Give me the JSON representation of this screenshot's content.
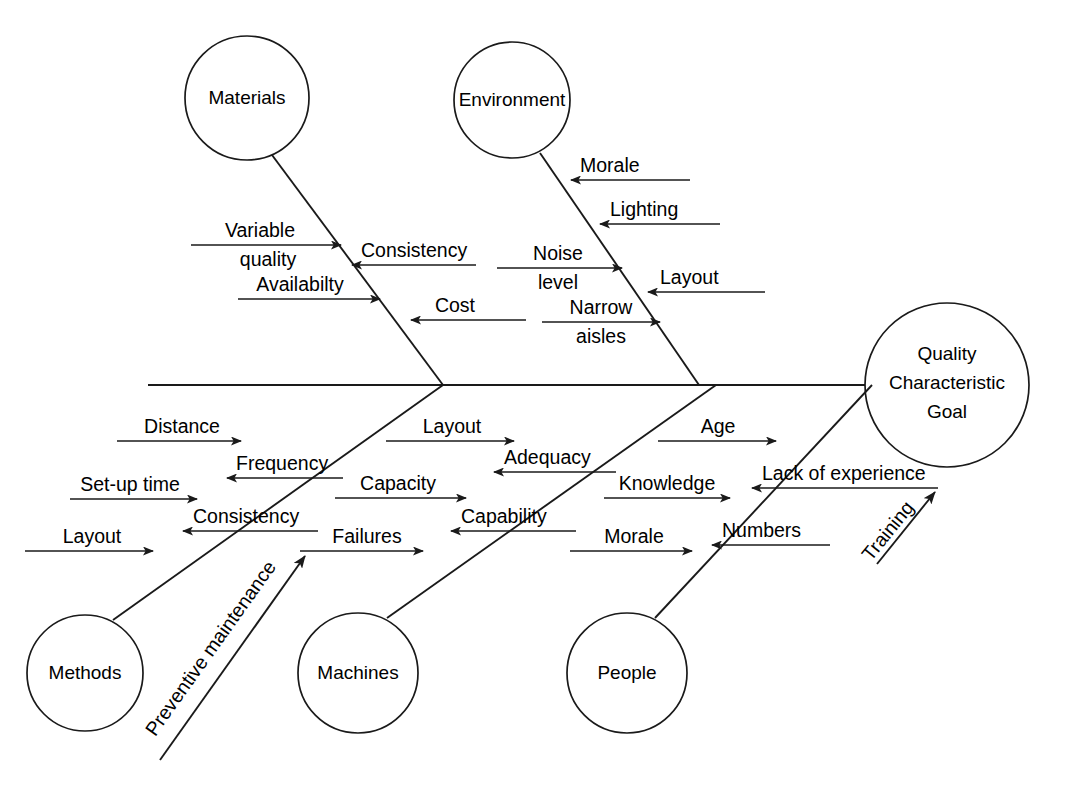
{
  "diagram": {
    "type": "fishbone-ishikawa-cause-and-effect",
    "head": {
      "lines": [
        "Quality",
        "Characteristic",
        "Goal"
      ]
    },
    "categories": [
      {
        "name": "Materials",
        "position": "top",
        "causes": [
          {
            "label": "Variable quality",
            "side": "left",
            "direction": "right"
          },
          {
            "label": "Availabilty",
            "side": "left",
            "direction": "right"
          },
          {
            "label": "Consistency",
            "side": "right",
            "direction": "left"
          },
          {
            "label": "Cost",
            "side": "right",
            "direction": "left"
          }
        ]
      },
      {
        "name": "Environment",
        "position": "top",
        "causes": [
          {
            "label": "Morale",
            "side": "right",
            "direction": "left"
          },
          {
            "label": "Lighting",
            "side": "right",
            "direction": "left"
          },
          {
            "label": "Noise level",
            "side": "left",
            "direction": "right"
          },
          {
            "label": "Layout",
            "side": "right",
            "direction": "left"
          },
          {
            "label": "Narrow aisles",
            "side": "left",
            "direction": "right"
          }
        ]
      },
      {
        "name": "Methods",
        "position": "bottom",
        "causes": [
          {
            "label": "Distance",
            "side": "left",
            "direction": "right"
          },
          {
            "label": "Frequency",
            "side": "right",
            "direction": "left"
          },
          {
            "label": "Set-up time",
            "side": "left",
            "direction": "right"
          },
          {
            "label": "Consistency",
            "side": "right",
            "direction": "left"
          },
          {
            "label": "Layout",
            "side": "left",
            "direction": "right"
          }
        ]
      },
      {
        "name": "Machines",
        "position": "bottom",
        "causes": [
          {
            "label": "Layout",
            "side": "left",
            "direction": "right"
          },
          {
            "label": "Adequacy",
            "side": "right",
            "direction": "left"
          },
          {
            "label": "Capacity",
            "side": "left",
            "direction": "right"
          },
          {
            "label": "Capability",
            "side": "right",
            "direction": "left"
          },
          {
            "label": "Failures",
            "side": "left",
            "direction": "right"
          }
        ]
      },
      {
        "name": "People",
        "position": "bottom",
        "causes": [
          {
            "label": "Age",
            "side": "left",
            "direction": "right"
          },
          {
            "label": "Knowledge",
            "side": "left",
            "direction": "right"
          },
          {
            "label": "Lack of experience",
            "side": "right",
            "direction": "left"
          },
          {
            "label": "Morale",
            "side": "left",
            "direction": "right"
          },
          {
            "label": "Numbers",
            "side": "right",
            "direction": "left"
          }
        ]
      }
    ],
    "diagonal_causes": [
      {
        "label": "Preventive maintenance",
        "direction": "up-right"
      },
      {
        "label": "Training",
        "direction": "up-right"
      }
    ],
    "labels": {
      "materials": "Materials",
      "environment": "Environment",
      "methods": "Methods",
      "machines": "Machines",
      "people": "People",
      "head_line1": "Quality",
      "head_line2": "Characteristic",
      "head_line3": "Goal",
      "mat_variable": "Variable",
      "mat_quality": "quality",
      "mat_availability": "Availabilty",
      "mat_consistency": "Consistency",
      "mat_cost": "Cost",
      "env_morale": "Morale",
      "env_lighting": "Lighting",
      "env_noise": "Noise",
      "env_level": "level",
      "env_layout": "Layout",
      "env_narrow": "Narrow",
      "env_aisles": "aisles",
      "met_distance": "Distance",
      "met_frequency": "Frequency",
      "met_setup": "Set-up time",
      "met_consistency": "Consistency",
      "met_layout": "Layout",
      "mac_layout": "Layout",
      "mac_adequacy": "Adequacy",
      "mac_capacity": "Capacity",
      "mac_capability": "Capability",
      "mac_failures": "Failures",
      "peo_age": "Age",
      "peo_knowledge": "Knowledge",
      "peo_lack": "Lack of experience",
      "peo_morale": "Morale",
      "peo_numbers": "Numbers",
      "diag_preventive": "Preventive maintenance",
      "diag_training": "Training"
    },
    "colors": {
      "stroke": "#1a1a1a",
      "background": "#ffffff",
      "text": "#000000"
    },
    "caption": ""
  }
}
